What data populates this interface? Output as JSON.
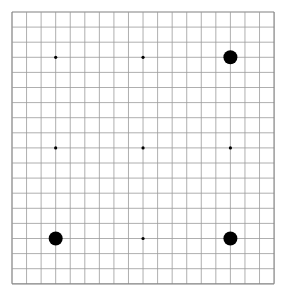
{
  "board": {
    "size": 19,
    "origin_x": 12,
    "origin_y": 12,
    "spacing_x": 14.56,
    "spacing_y": 15.1,
    "line_color": "#9a9a9a",
    "border_color": "#808080",
    "background": "#ffffff",
    "star_points": [
      [
        3,
        3
      ],
      [
        9,
        3
      ],
      [
        15,
        3
      ],
      [
        3,
        9
      ],
      [
        9,
        9
      ],
      [
        15,
        9
      ],
      [
        3,
        15
      ],
      [
        9,
        15
      ],
      [
        15,
        15
      ]
    ],
    "star_radius": 1.6,
    "stone_radius": 7,
    "stones": [
      {
        "col": 15,
        "row": 3,
        "color": "black"
      },
      {
        "col": 3,
        "row": 15,
        "color": "black"
      },
      {
        "col": 15,
        "row": 15,
        "color": "black"
      }
    ]
  }
}
